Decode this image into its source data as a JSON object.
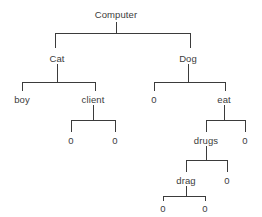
{
  "diagram": {
    "type": "tree",
    "title": "Computer",
    "background_color": "#ffffff",
    "line_color": "#3b3b3b",
    "text_color": "#3b3b3b",
    "nodes": [
      {
        "id": "computer",
        "label": "Computer",
        "x": 116,
        "y": 14,
        "depth": 0
      },
      {
        "id": "cat",
        "label": "Cat",
        "x": 57,
        "y": 58,
        "depth": 1
      },
      {
        "id": "dog",
        "label": "Dog",
        "x": 188,
        "y": 58,
        "depth": 1
      },
      {
        "id": "boy",
        "label": "boy",
        "x": 22,
        "y": 99,
        "depth": 2
      },
      {
        "id": "client",
        "label": "client",
        "x": 93,
        "y": 99,
        "depth": 2
      },
      {
        "id": "dog0",
        "label": "0",
        "x": 154,
        "y": 99,
        "depth": 2
      },
      {
        "id": "eat",
        "label": "eat",
        "x": 224,
        "y": 99,
        "depth": 2
      },
      {
        "id": "client0a",
        "label": "0",
        "x": 71,
        "y": 140,
        "depth": 3
      },
      {
        "id": "client0b",
        "label": "0",
        "x": 115,
        "y": 140,
        "depth": 3
      },
      {
        "id": "drugs",
        "label": "drugs",
        "x": 206,
        "y": 140,
        "depth": 3
      },
      {
        "id": "eat0",
        "label": "0",
        "x": 245,
        "y": 140,
        "depth": 3
      },
      {
        "id": "drag",
        "label": "drag",
        "x": 186,
        "y": 180,
        "depth": 4
      },
      {
        "id": "drugs0",
        "label": "0",
        "x": 227,
        "y": 180,
        "depth": 4
      },
      {
        "id": "drag0a",
        "label": "0",
        "x": 163,
        "y": 208,
        "depth": 5
      },
      {
        "id": "drag0b",
        "label": "0",
        "x": 205,
        "y": 208,
        "depth": 5
      }
    ],
    "edges": [
      {
        "parent": "computer",
        "child": "cat"
      },
      {
        "parent": "computer",
        "child": "dog"
      },
      {
        "parent": "cat",
        "child": "boy"
      },
      {
        "parent": "cat",
        "child": "client"
      },
      {
        "parent": "dog",
        "child": "dog0"
      },
      {
        "parent": "dog",
        "child": "eat"
      },
      {
        "parent": "client",
        "child": "client0a"
      },
      {
        "parent": "client",
        "child": "client0b"
      },
      {
        "parent": "eat",
        "child": "drugs"
      },
      {
        "parent": "eat",
        "child": "eat0"
      },
      {
        "parent": "drugs",
        "child": "drag"
      },
      {
        "parent": "drugs",
        "child": "drugs0"
      },
      {
        "parent": "drag",
        "child": "drag0a"
      },
      {
        "parent": "drag",
        "child": "drag0b"
      }
    ],
    "connectors": [
      {
        "id": "c-computer",
        "stem_x": 116,
        "stem_top": 22,
        "bar_y": 33,
        "bar_left": 55,
        "bar_right": 190,
        "drop_bottom": 48
      },
      {
        "id": "c-cat",
        "stem_x": 57,
        "stem_top": 64,
        "bar_y": 82,
        "bar_left": 22,
        "bar_right": 95,
        "drop_bottom": 91
      },
      {
        "id": "c-dog",
        "stem_x": 188,
        "stem_top": 64,
        "bar_y": 82,
        "bar_left": 154,
        "bar_right": 225,
        "drop_bottom": 91
      },
      {
        "id": "c-client",
        "stem_x": 93,
        "stem_top": 105,
        "bar_y": 120,
        "bar_left": 71,
        "bar_right": 115,
        "drop_bottom": 132
      },
      {
        "id": "c-eat",
        "stem_x": 224,
        "stem_top": 105,
        "bar_y": 120,
        "bar_left": 206,
        "bar_right": 245,
        "drop_bottom": 132
      },
      {
        "id": "c-drugs",
        "stem_x": 206,
        "stem_top": 146,
        "bar_y": 160,
        "bar_left": 186,
        "bar_right": 227,
        "drop_bottom": 172
      },
      {
        "id": "c-drag",
        "stem_x": 186,
        "stem_top": 186,
        "bar_y": 196,
        "bar_left": 163,
        "bar_right": 205,
        "drop_bottom": 201
      }
    ]
  }
}
